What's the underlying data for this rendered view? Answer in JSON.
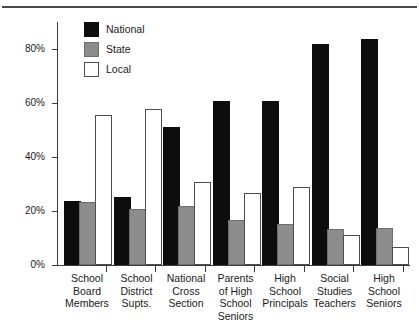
{
  "chart_data": {
    "type": "bar",
    "title": "",
    "subtitle": "",
    "xlabel": "",
    "ylabel": "",
    "ylim": [
      0,
      90
    ],
    "grid": false,
    "legend_position": "top-left-inside",
    "y_ticks": [
      {
        "value": 0,
        "label": "0%"
      },
      {
        "value": 20,
        "label": "20%"
      },
      {
        "value": 40,
        "label": "40%"
      },
      {
        "value": 60,
        "label": "60%"
      },
      {
        "value": 80,
        "label": "80%"
      }
    ],
    "categories": [
      "School Board Members",
      "School District Supts.",
      "National Cross Section",
      "Parents of High School Seniors",
      "High School Principals",
      "Social Studies Teachers",
      "High School Seniors"
    ],
    "category_lines": [
      [
        "School",
        "Board",
        "Members"
      ],
      [
        "School",
        "District",
        "Supts."
      ],
      [
        "National",
        "Cross",
        "Section"
      ],
      [
        "Parents",
        "of High",
        "School",
        "Seniors"
      ],
      [
        "High",
        "School",
        "Principals"
      ],
      [
        "Social",
        "Studies",
        "Teachers"
      ],
      [
        "High",
        "School",
        "Seniors"
      ]
    ],
    "series": [
      {
        "name": "National",
        "color": "#0d0d0d",
        "values": [
          23,
          24.5,
          50.5,
          60,
          60,
          81,
          83
        ]
      },
      {
        "name": "State",
        "color": "#8c8c8c",
        "values": [
          22.5,
          20,
          21,
          16,
          14.5,
          12.5,
          13
        ]
      },
      {
        "name": "Local",
        "color": "#ffffff",
        "values": [
          55,
          57,
          30,
          26,
          28,
          10.5,
          6
        ]
      }
    ]
  },
  "legend": {
    "items": [
      {
        "label": "National",
        "swatch": "national"
      },
      {
        "label": "State",
        "swatch": "state"
      },
      {
        "label": "Local",
        "swatch": "local"
      }
    ]
  }
}
